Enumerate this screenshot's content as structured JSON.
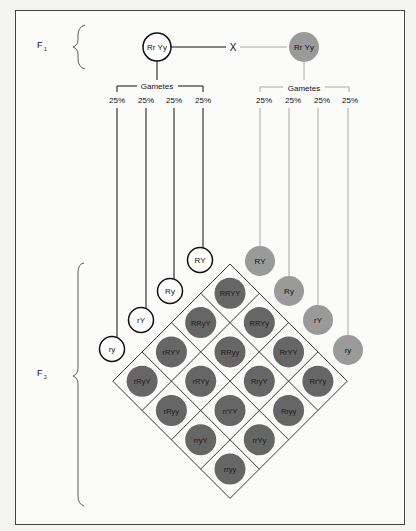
{
  "labels": {
    "f1": "F",
    "f1_sub": "1",
    "f2": "F",
    "f2_sub": "2",
    "cross": "X"
  },
  "parents": [
    {
      "genotype": "Rr Yy",
      "style": "outline"
    },
    {
      "genotype": "Rr Yy",
      "style": "gray"
    }
  ],
  "gametes_label": "Gametes",
  "gamete_percent": [
    "25%",
    "25%",
    "25%",
    "25%"
  ],
  "left_gametes": [
    "RY",
    "Ry",
    "rY",
    "ry"
  ],
  "right_gametes": [
    "RY",
    "Ry",
    "rY",
    "ry"
  ],
  "offspring_grid": [
    [
      "RRYY",
      "RRYy",
      "RrYY",
      "RrYy"
    ],
    [
      "RRyY",
      "RRyy",
      "RryY",
      "Rryy"
    ],
    [
      "rRYY",
      "rRYy",
      "rrYY",
      "rrYy"
    ],
    [
      "rRyY",
      "rRyy",
      "rryY",
      "rryy"
    ]
  ],
  "colors": {
    "outline": "#111111",
    "light_gray": "#9a9a9a",
    "dark_gray": "#666666",
    "line_gray": "#a8a8a8"
  }
}
